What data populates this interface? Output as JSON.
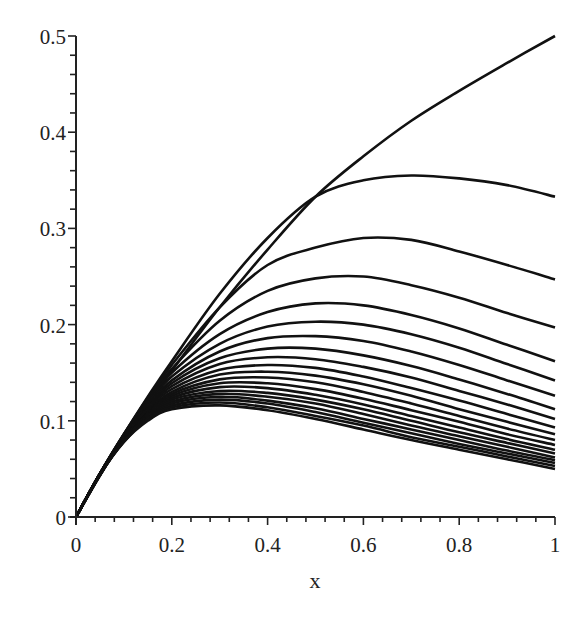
{
  "chart_data": {
    "type": "line",
    "title": "",
    "xlabel": "x",
    "ylabel": "",
    "xlim": [
      0,
      1
    ],
    "ylim": [
      0,
      0.5
    ],
    "grid": false,
    "legend": null,
    "x_ticks": [
      "0",
      "0.2",
      "0.4",
      "0.6",
      "0.8",
      "1"
    ],
    "y_ticks": [
      "0",
      "0.1",
      "0.2",
      "0.3",
      "0.4",
      "0.5"
    ],
    "x": [
      0,
      0.05,
      0.1,
      0.15,
      0.2,
      0.3,
      0.4,
      0.5,
      0.6,
      0.7,
      0.8,
      0.9,
      1.0
    ],
    "line_color": "#111111",
    "series": [
      {
        "name": "curve-1",
        "values": [
          0,
          0.043,
          0.082,
          0.118,
          0.152,
          0.218,
          0.278,
          0.333,
          0.375,
          0.412,
          0.443,
          0.472,
          0.5
        ]
      },
      {
        "name": "curve-2",
        "values": [
          0,
          0.045,
          0.086,
          0.125,
          0.162,
          0.232,
          0.29,
          0.333,
          0.35,
          0.355,
          0.352,
          0.345,
          0.333
        ]
      },
      {
        "name": "curve-3",
        "values": [
          0,
          0.045,
          0.086,
          0.124,
          0.158,
          0.218,
          0.262,
          0.28,
          0.29,
          0.288,
          0.276,
          0.262,
          0.247
        ]
      },
      {
        "name": "curve-4",
        "values": [
          0,
          0.045,
          0.086,
          0.122,
          0.154,
          0.204,
          0.235,
          0.248,
          0.25,
          0.241,
          0.228,
          0.212,
          0.197
        ]
      },
      {
        "name": "curve-5",
        "values": [
          0,
          0.045,
          0.085,
          0.12,
          0.15,
          0.19,
          0.213,
          0.222,
          0.22,
          0.21,
          0.196,
          0.179,
          0.162
        ]
      },
      {
        "name": "curve-6",
        "values": [
          0,
          0.045,
          0.085,
          0.118,
          0.146,
          0.18,
          0.198,
          0.203,
          0.2,
          0.19,
          0.176,
          0.159,
          0.142
        ]
      },
      {
        "name": "curve-7",
        "values": [
          0,
          0.045,
          0.084,
          0.116,
          0.142,
          0.172,
          0.186,
          0.188,
          0.183,
          0.172,
          0.158,
          0.142,
          0.126
        ]
      },
      {
        "name": "curve-8",
        "values": [
          0,
          0.045,
          0.084,
          0.114,
          0.139,
          0.165,
          0.175,
          0.175,
          0.168,
          0.157,
          0.143,
          0.128,
          0.112
        ]
      },
      {
        "name": "curve-9",
        "values": [
          0,
          0.045,
          0.083,
          0.113,
          0.136,
          0.159,
          0.166,
          0.164,
          0.156,
          0.145,
          0.131,
          0.117,
          0.102
        ]
      },
      {
        "name": "curve-10",
        "values": [
          0,
          0.045,
          0.083,
          0.112,
          0.133,
          0.153,
          0.158,
          0.155,
          0.146,
          0.134,
          0.121,
          0.107,
          0.093
        ]
      },
      {
        "name": "curve-11",
        "values": [
          0,
          0.045,
          0.082,
          0.11,
          0.13,
          0.148,
          0.151,
          0.147,
          0.138,
          0.126,
          0.112,
          0.099,
          0.086
        ]
      },
      {
        "name": "curve-12",
        "values": [
          0,
          0.045,
          0.082,
          0.109,
          0.128,
          0.143,
          0.145,
          0.14,
          0.13,
          0.118,
          0.105,
          0.092,
          0.08
        ]
      },
      {
        "name": "curve-13",
        "values": [
          0,
          0.044,
          0.081,
          0.108,
          0.126,
          0.139,
          0.139,
          0.133,
          0.123,
          0.111,
          0.099,
          0.086,
          0.075
        ]
      },
      {
        "name": "curve-14",
        "values": [
          0,
          0.044,
          0.081,
          0.107,
          0.124,
          0.135,
          0.134,
          0.127,
          0.117,
          0.105,
          0.093,
          0.081,
          0.07
        ]
      },
      {
        "name": "curve-15",
        "values": [
          0,
          0.044,
          0.08,
          0.106,
          0.122,
          0.131,
          0.129,
          0.122,
          0.112,
          0.1,
          0.088,
          0.077,
          0.066
        ]
      },
      {
        "name": "curve-16",
        "values": [
          0,
          0.044,
          0.08,
          0.105,
          0.12,
          0.128,
          0.125,
          0.118,
          0.107,
          0.095,
          0.084,
          0.073,
          0.062
        ]
      },
      {
        "name": "curve-17",
        "values": [
          0,
          0.044,
          0.079,
          0.104,
          0.118,
          0.125,
          0.121,
          0.113,
          0.102,
          0.091,
          0.08,
          0.069,
          0.059
        ]
      },
      {
        "name": "curve-18",
        "values": [
          0,
          0.044,
          0.079,
          0.103,
          0.116,
          0.122,
          0.118,
          0.109,
          0.098,
          0.087,
          0.076,
          0.066,
          0.056
        ]
      },
      {
        "name": "curve-19",
        "values": [
          0,
          0.044,
          0.078,
          0.102,
          0.114,
          0.119,
          0.114,
          0.105,
          0.095,
          0.083,
          0.073,
          0.063,
          0.053
        ]
      },
      {
        "name": "curve-20",
        "values": [
          0,
          0.044,
          0.078,
          0.1,
          0.112,
          0.116,
          0.111,
          0.102,
          0.091,
          0.08,
          0.07,
          0.06,
          0.05
        ]
      }
    ]
  },
  "axes": {
    "x_label": "x",
    "x_ticks": [
      {
        "value": 0,
        "label": "0"
      },
      {
        "value": 0.2,
        "label": "0.2"
      },
      {
        "value": 0.4,
        "label": "0.4"
      },
      {
        "value": 0.6,
        "label": "0.6"
      },
      {
        "value": 0.8,
        "label": "0.8"
      },
      {
        "value": 1,
        "label": "1"
      }
    ],
    "y_ticks": [
      {
        "value": 0,
        "label": "0"
      },
      {
        "value": 0.1,
        "label": "0.1"
      },
      {
        "value": 0.2,
        "label": "0.2"
      },
      {
        "value": 0.3,
        "label": "0.3"
      },
      {
        "value": 0.4,
        "label": "0.4"
      },
      {
        "value": 0.5,
        "label": "0.5"
      }
    ]
  }
}
